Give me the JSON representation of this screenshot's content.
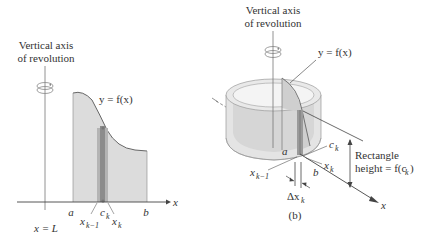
{
  "panel_a": {
    "axis_label_line1": "Vertical axis",
    "axis_label_line2": "of revolution",
    "curve_label": "y = f(x)",
    "x_axis_label": "x",
    "axis_line_label": "x = L",
    "tick_a": "a",
    "tick_b": "b",
    "tick_ck": "c",
    "tick_ck_sub": "k",
    "tick_xk1": "x",
    "tick_xk1_sub": "k−1",
    "tick_xk": "x",
    "tick_xk_sub": "k",
    "caption": "(a)"
  },
  "panel_b": {
    "axis_label_line1": "Vertical axis",
    "axis_label_line2": "of revolution",
    "curve_label": "y = f(x)",
    "x_axis_label": "x",
    "tick_a": "a",
    "tick_b": "b",
    "tick_ck": "c",
    "tick_ck_sub": "k",
    "tick_xk1": "x",
    "tick_xk1_sub": "k−1",
    "tick_xk": "x",
    "tick_xk_sub": "k",
    "delta_label": "Δx",
    "delta_sub": "k",
    "rect_label_line1": "Rectangle",
    "rect_label_line2": "height = f(c",
    "rect_label_sub": "k",
    "rect_label_close": ")",
    "caption": "(b)"
  },
  "colors": {
    "region_fill": "#dcdcdc",
    "strip_fill": "#8c8c8c",
    "strip_light": "#b4b4b4",
    "line": "#555555",
    "text": "#333333",
    "shell_fill": "#e4e4e4",
    "shell_edge": "#9a9a9a"
  }
}
